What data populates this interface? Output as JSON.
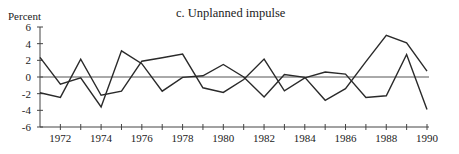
{
  "chart_data": {
    "type": "line",
    "title": "c. Unplanned impulse",
    "ylabel": "Percent",
    "xlabel": "",
    "ylim": [
      -6,
      6
    ],
    "yticks": [
      6,
      4,
      2,
      0,
      -2,
      -4,
      -6
    ],
    "xlim": [
      1971,
      1990
    ],
    "xtick_labels": [
      "1972",
      "1974",
      "1976",
      "1978",
      "1980",
      "1982",
      "1984",
      "1986",
      "1988",
      "1990"
    ],
    "x": [
      1971,
      1972,
      1973,
      1974,
      1975,
      1976,
      1977,
      1978,
      1979,
      1980,
      1981,
      1982,
      1983,
      1984,
      1985,
      1986,
      1987,
      1988,
      1989,
      1990
    ],
    "series": [
      {
        "name": "Series 1",
        "values": [
          2.35,
          -0.85,
          -0.1,
          -3.6,
          3.15,
          1.6,
          -1.7,
          -0.05,
          0.15,
          1.5,
          0.0,
          -2.4,
          0.3,
          -0.05,
          -2.8,
          -1.4,
          1.85,
          5.0,
          4.1,
          0.7
        ]
      },
      {
        "name": "Series 2",
        "values": [
          -1.9,
          -2.45,
          2.15,
          -2.2,
          -1.7,
          1.9,
          2.3,
          2.75,
          -1.3,
          -1.85,
          -0.3,
          2.15,
          -1.65,
          -0.1,
          0.6,
          0.35,
          -2.45,
          -2.25,
          2.7,
          -3.9
        ]
      }
    ],
    "zero_line": true,
    "grid": false,
    "legend": null
  }
}
